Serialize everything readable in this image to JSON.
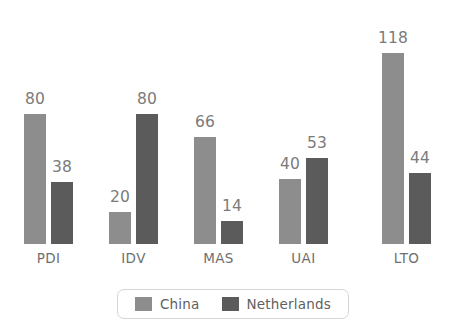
{
  "chart_data": {
    "type": "bar",
    "title": "",
    "subtitle": "",
    "xlabel": "",
    "ylabel": "",
    "grid": false,
    "axis_visible": false,
    "legend_position": "bottom",
    "ylim": [
      0,
      118
    ],
    "categories": [
      "PDI",
      "IDV",
      "MAS",
      "UAI",
      "LTO"
    ],
    "series": [
      {
        "name": "China",
        "color": "#8d8d8d",
        "values": [
          80,
          20,
          66,
          40,
          118
        ]
      },
      {
        "name": "Netherlands",
        "color": "#5b5b5b",
        "values": [
          38,
          80,
          14,
          53,
          44
        ]
      }
    ]
  },
  "legend": {
    "items": [
      {
        "label": "China",
        "swatch_color": "#8d8d8d"
      },
      {
        "label": "Netherlands",
        "swatch_color": "#5b5b5b"
      }
    ]
  },
  "colors": {
    "background": "#ffffff",
    "value_label": "#7b7b7b",
    "category_label": "#6f6f6f",
    "legend_border": "#d5d5d5",
    "legend_text": "#5f5f5f"
  }
}
